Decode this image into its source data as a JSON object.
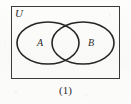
{
  "figure": {
    "kind": "venn-diagram",
    "universal_set_label": "U",
    "caption": "(1)",
    "sets": [
      {
        "id": "A",
        "label": "A",
        "position": "left"
      },
      {
        "id": "B",
        "label": "B",
        "position": "right"
      }
    ],
    "colors": {
      "stroke": "#2b2b2b",
      "fill": "none",
      "background": "#fbfbfa",
      "text": "#2b2b2b"
    },
    "geometry": {
      "rect": {
        "x": 11,
        "y": 6,
        "width": 109,
        "height": 73,
        "stroke_width": 1.4
      },
      "ellipse_A": {
        "cx": 48,
        "cy": 43,
        "rx": 31,
        "ry": 21,
        "stroke_width": 1.5
      },
      "ellipse_B": {
        "cx": 83,
        "cy": 43,
        "rx": 31,
        "ry": 21,
        "stroke_width": 1.5
      }
    }
  }
}
